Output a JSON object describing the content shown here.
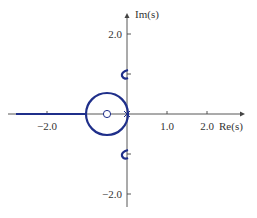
{
  "diagram": {
    "type": "root-locus",
    "axes": {
      "x_label": "Re(s)",
      "y_label": "Im(s)",
      "x_ticks": [
        {
          "value": -2.0,
          "label": "−2.0"
        },
        {
          "value": 1.0,
          "label": "1.0"
        },
        {
          "value": 2.0,
          "label": "2.0"
        }
      ],
      "y_ticks": [
        {
          "value": 2.0,
          "label": "2.0"
        },
        {
          "value": -2.0,
          "label": "−2.0"
        }
      ]
    },
    "poles": [
      {
        "re": 0.0,
        "im": 0.0,
        "symbol": "x"
      }
    ],
    "zeros": [
      {
        "re": -0.5,
        "im": 0.0,
        "symbol": "o"
      }
    ],
    "branches": [
      {
        "kind": "circle",
        "center_re": -0.5,
        "center_im": 0.0,
        "radius": 0.52
      },
      {
        "kind": "real-axis-ray",
        "from_re": -1.02,
        "to_re": "-inf"
      },
      {
        "kind": "hook",
        "re": -0.05,
        "im": 1.0
      },
      {
        "kind": "hook",
        "re": -0.05,
        "im": -1.0
      }
    ],
    "colors": {
      "locus": "#1f2f8a",
      "axis": "#444444",
      "text": "#333333"
    }
  }
}
